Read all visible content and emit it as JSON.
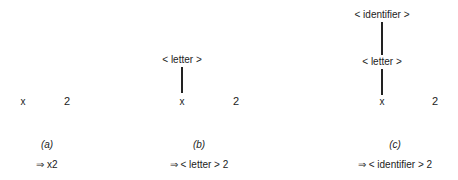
{
  "panels": [
    {
      "caption": "(a)",
      "nodes": {
        "leaf_x": "x",
        "leaf_2": "2"
      },
      "derivation": "⇒ x2"
    },
    {
      "caption": "(b)",
      "nodes": {
        "letter": "< letter >",
        "leaf_x": "x",
        "leaf_2": "2"
      },
      "derivation": "⇒ < letter > 2"
    },
    {
      "caption": "(c)",
      "nodes": {
        "identifier": "< identifier >",
        "letter": "< letter >",
        "leaf_x": "x",
        "leaf_2": "2"
      },
      "derivation": "⇒ < identifier > 2"
    }
  ]
}
